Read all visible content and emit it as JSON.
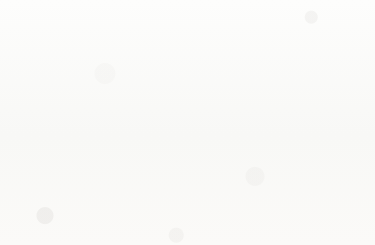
{
  "chart_data": {
    "type": "line",
    "title": "",
    "subtitle": "",
    "xlabel": "",
    "ylabel": "",
    "categories": [
      "California",
      "New Jersey",
      "Georgia",
      "Minnesota",
      "Virginia",
      "Colorado",
      "Washington",
      "Arizona",
      "Oregon",
      "Nebraska"
    ],
    "values": [
      155000,
      52000,
      44000,
      39000,
      33000,
      28000,
      23000,
      20000,
      15000,
      11500
    ],
    "series": [
      {
        "name": "",
        "values": [
          155000,
          52000,
          44000,
          39000,
          33000,
          28000,
          23000,
          20000,
          15000,
          11500
        ]
      }
    ],
    "ylim": [
      0,
      180000
    ],
    "ytick_values": [
      0,
      20000,
      40000,
      60000,
      80000,
      100000,
      120000,
      140000,
      160000,
      180000
    ],
    "ytick_labels": [
      "0",
      "20,000",
      "40,000",
      "60,000",
      "80,000",
      "1,00,000",
      "1,20,000",
      "1,40,000",
      "1,60,000",
      "1,80,000"
    ],
    "grid": true,
    "grid_axis": "y",
    "legend": false,
    "legend_position": "none",
    "xtick_label_rotation": -45,
    "markers": false,
    "line_color": "#6b6b6b",
    "gridline_color": "#cdcdcd",
    "axis_color": "#b9b9b9",
    "text_color": "#2e2e2e",
    "background_color": "#fbfbfa"
  }
}
